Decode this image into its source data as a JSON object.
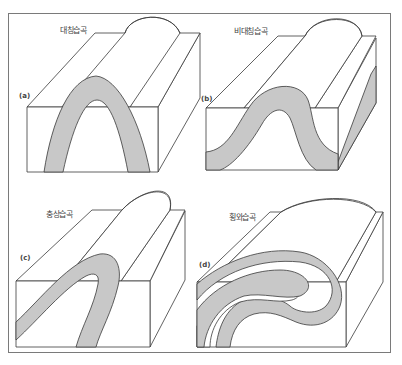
{
  "figure": {
    "colors": {
      "layer_fill": "#c8c8c8",
      "line": "#3a3a3a",
      "frame": "#7a7a7a",
      "background": "#ffffff"
    },
    "panels": [
      {
        "tag": "(a)",
        "label": "대칭습곡"
      },
      {
        "tag": "(b)",
        "label": "비대칭습곡"
      },
      {
        "tag": "(c)",
        "label": "충상습곡"
      },
      {
        "tag": "(d)",
        "label": "횡와습곡"
      }
    ]
  }
}
